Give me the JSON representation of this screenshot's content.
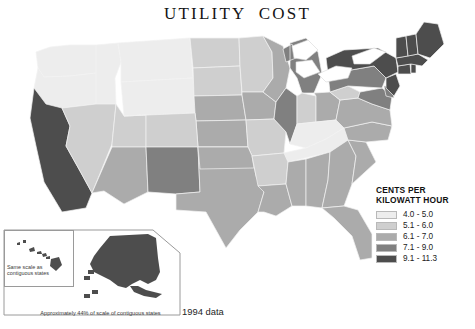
{
  "title": "UTILITY  COST",
  "footnote": "1994 data",
  "legend": {
    "heading_line1": "CENTS PER",
    "heading_line2": "KILOWATT HOUR",
    "bins": [
      {
        "label": "4.0 - 5.0",
        "color": "#ededed"
      },
      {
        "label": "5.1 - 6.0",
        "color": "#cfcfcf"
      },
      {
        "label": "6.1 - 7.0",
        "color": "#ababab"
      },
      {
        "label": "7.1 - 9.0",
        "color": "#808080"
      },
      {
        "label": "9.1 - 11.3",
        "color": "#4d4d4d"
      }
    ]
  },
  "insets": {
    "hawaii_caption": "Same scale as\ncontiguous states",
    "alaska_caption": "Approximately 44% of scale of contiguous states"
  },
  "chart_data": {
    "type": "map",
    "title": "UTILITY  COST",
    "subtitle": "1994 data",
    "value_unit": "cents per kilowatt hour",
    "legend_bins": [
      {
        "range": [
          4.0,
          5.0
        ],
        "label": "4.0 - 5.0",
        "color": "#ededed"
      },
      {
        "range": [
          5.1,
          6.0
        ],
        "label": "5.1 - 6.0",
        "color": "#cfcfcf"
      },
      {
        "range": [
          6.1,
          7.0
        ],
        "label": "6.1 - 7.0",
        "color": "#ababab"
      },
      {
        "range": [
          7.1,
          9.0
        ],
        "label": "7.1 - 9.0",
        "color": "#808080"
      },
      {
        "range": [
          9.1,
          11.3
        ],
        "label": "9.1 - 11.3",
        "color": "#4d4d4d"
      }
    ],
    "states": [
      {
        "code": "WA",
        "name": "Washington",
        "bin": 0,
        "color": "#ededed"
      },
      {
        "code": "OR",
        "name": "Oregon",
        "bin": 0,
        "color": "#ededed"
      },
      {
        "code": "ID",
        "name": "Idaho",
        "bin": 0,
        "color": "#ededed"
      },
      {
        "code": "MT",
        "name": "Montana",
        "bin": 0,
        "color": "#ededed"
      },
      {
        "code": "WY",
        "name": "Wyoming",
        "bin": 0,
        "color": "#ededed"
      },
      {
        "code": "ND",
        "name": "North Dakota",
        "bin": 1,
        "color": "#cfcfcf"
      },
      {
        "code": "SD",
        "name": "South Dakota",
        "bin": 1,
        "color": "#cfcfcf"
      },
      {
        "code": "NE",
        "name": "Nebraska",
        "bin": 2,
        "color": "#ababab"
      },
      {
        "code": "KS",
        "name": "Kansas",
        "bin": 2,
        "color": "#ababab"
      },
      {
        "code": "MN",
        "name": "Minnesota",
        "bin": 1,
        "color": "#cfcfcf"
      },
      {
        "code": "IA",
        "name": "Iowa",
        "bin": 2,
        "color": "#ababab"
      },
      {
        "code": "MO",
        "name": "Missouri",
        "bin": 1,
        "color": "#cfcfcf"
      },
      {
        "code": "WI",
        "name": "Wisconsin",
        "bin": 2,
        "color": "#ababab"
      },
      {
        "code": "IL",
        "name": "Illinois",
        "bin": 3,
        "color": "#808080"
      },
      {
        "code": "MI",
        "name": "Michigan",
        "bin": 3,
        "color": "#808080"
      },
      {
        "code": "IN",
        "name": "Indiana",
        "bin": 1,
        "color": "#cfcfcf"
      },
      {
        "code": "OH",
        "name": "Ohio",
        "bin": 2,
        "color": "#ababab"
      },
      {
        "code": "KY",
        "name": "Kentucky",
        "bin": 0,
        "color": "#ededed"
      },
      {
        "code": "TN",
        "name": "Tennessee",
        "bin": 0,
        "color": "#ededed"
      },
      {
        "code": "CA",
        "name": "California",
        "bin": 4,
        "color": "#4d4d4d"
      },
      {
        "code": "NV",
        "name": "Nevada",
        "bin": 1,
        "color": "#cfcfcf"
      },
      {
        "code": "UT",
        "name": "Utah",
        "bin": 1,
        "color": "#cfcfcf"
      },
      {
        "code": "AZ",
        "name": "Arizona",
        "bin": 2,
        "color": "#ababab"
      },
      {
        "code": "CO",
        "name": "Colorado",
        "bin": 1,
        "color": "#cfcfcf"
      },
      {
        "code": "NM",
        "name": "New Mexico",
        "bin": 3,
        "color": "#808080"
      },
      {
        "code": "TX",
        "name": "Texas",
        "bin": 2,
        "color": "#ababab"
      },
      {
        "code": "OK",
        "name": "Oklahoma",
        "bin": 2,
        "color": "#ababab"
      },
      {
        "code": "AR",
        "name": "Arkansas",
        "bin": 1,
        "color": "#cfcfcf"
      },
      {
        "code": "LA",
        "name": "Louisiana",
        "bin": 2,
        "color": "#ababab"
      },
      {
        "code": "MS",
        "name": "Mississippi",
        "bin": 2,
        "color": "#ababab"
      },
      {
        "code": "AL",
        "name": "Alabama",
        "bin": 2,
        "color": "#ababab"
      },
      {
        "code": "GA",
        "name": "Georgia",
        "bin": 2,
        "color": "#ababab"
      },
      {
        "code": "FL",
        "name": "Florida",
        "bin": 2,
        "color": "#ababab"
      },
      {
        "code": "SC",
        "name": "South Carolina",
        "bin": 2,
        "color": "#ababab"
      },
      {
        "code": "NC",
        "name": "North Carolina",
        "bin": 2,
        "color": "#ababab"
      },
      {
        "code": "VA",
        "name": "Virginia",
        "bin": 2,
        "color": "#ababab"
      },
      {
        "code": "WV",
        "name": "West Virginia",
        "bin": 1,
        "color": "#cfcfcf"
      },
      {
        "code": "MD",
        "name": "Maryland",
        "bin": 3,
        "color": "#808080"
      },
      {
        "code": "DE",
        "name": "Delaware",
        "bin": 3,
        "color": "#808080"
      },
      {
        "code": "PA",
        "name": "Pennsylvania",
        "bin": 3,
        "color": "#808080"
      },
      {
        "code": "NJ",
        "name": "New Jersey",
        "bin": 4,
        "color": "#4d4d4d"
      },
      {
        "code": "NY",
        "name": "New York",
        "bin": 4,
        "color": "#4d4d4d"
      },
      {
        "code": "CT",
        "name": "Connecticut",
        "bin": 4,
        "color": "#4d4d4d"
      },
      {
        "code": "RI",
        "name": "Rhode Island",
        "bin": 4,
        "color": "#4d4d4d"
      },
      {
        "code": "MA",
        "name": "Massachusetts",
        "bin": 4,
        "color": "#4d4d4d"
      },
      {
        "code": "VT",
        "name": "Vermont",
        "bin": 4,
        "color": "#4d4d4d"
      },
      {
        "code": "NH",
        "name": "New Hampshire",
        "bin": 4,
        "color": "#4d4d4d"
      },
      {
        "code": "ME",
        "name": "Maine",
        "bin": 4,
        "color": "#4d4d4d"
      },
      {
        "code": "AK",
        "name": "Alaska",
        "bin": 4,
        "color": "#4d4d4d"
      },
      {
        "code": "HI",
        "name": "Hawaii",
        "bin": 4,
        "color": "#4d4d4d"
      }
    ]
  }
}
